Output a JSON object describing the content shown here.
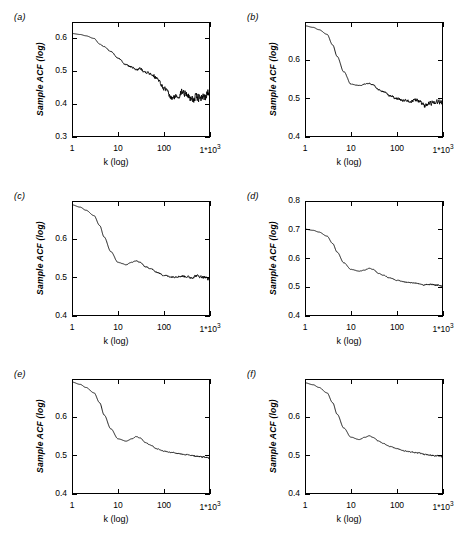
{
  "figure": {
    "layout": "2 columns x 3 rows",
    "axis_titles": {
      "y": "Sample ACF (log)",
      "x": "k (log)"
    },
    "xticks": [
      {
        "label": "1",
        "value": 1
      },
      {
        "label": "10",
        "value": 10
      },
      {
        "label": "100",
        "value": 100
      },
      {
        "label": "1*10",
        "exp": "3",
        "value": 1000
      }
    ]
  },
  "chart_data": [
    {
      "type": "line",
      "panel": "(a)",
      "title": "",
      "xlabel": "k (log)",
      "ylabel": "Sample ACF (log)",
      "xscale": "log",
      "xlim": [
        1,
        1000
      ],
      "ylim": [
        0.3,
        0.65
      ],
      "yticks": [
        0.3,
        0.4,
        0.5,
        0.6
      ],
      "xticks": [
        1,
        10,
        100,
        1000
      ],
      "grid": false,
      "legend": "none",
      "noise_amplitude": 0.022,
      "x": [
        1,
        1.5,
        2,
        3,
        4,
        5,
        7,
        10,
        15,
        20,
        25,
        30,
        40,
        50,
        70,
        100,
        150,
        200,
        250,
        300,
        400,
        500,
        700,
        1000
      ],
      "y": [
        0.615,
        0.612,
        0.608,
        0.6,
        0.583,
        0.575,
        0.56,
        0.54,
        0.52,
        0.512,
        0.505,
        0.508,
        0.498,
        0.494,
        0.48,
        0.448,
        0.418,
        0.425,
        0.438,
        0.432,
        0.415,
        0.42,
        0.418,
        0.44
      ]
    },
    {
      "type": "line",
      "panel": "(b)",
      "title": "",
      "xlabel": "k (log)",
      "ylabel": "Sample ACF (log)",
      "xscale": "log",
      "xlim": [
        1,
        1000
      ],
      "ylim": [
        0.4,
        0.7
      ],
      "yticks": [
        0.4,
        0.5,
        0.6
      ],
      "xticks": [
        1,
        10,
        100,
        1000
      ],
      "grid": false,
      "legend": "none",
      "noise_amplitude": 0.01,
      "x": [
        1,
        1.5,
        2,
        3,
        4,
        5,
        7,
        10,
        15,
        20,
        25,
        30,
        40,
        50,
        70,
        100,
        150,
        200,
        250,
        300,
        400,
        500,
        700,
        1000
      ],
      "y": [
        0.69,
        0.686,
        0.68,
        0.668,
        0.64,
        0.61,
        0.57,
        0.538,
        0.534,
        0.538,
        0.54,
        0.536,
        0.524,
        0.518,
        0.508,
        0.5,
        0.494,
        0.492,
        0.496,
        0.494,
        0.48,
        0.488,
        0.492,
        0.49
      ]
    },
    {
      "type": "line",
      "panel": "(c)",
      "title": "",
      "xlabel": "k (log)",
      "ylabel": "Sample ACF (log)",
      "xscale": "log",
      "xlim": [
        1,
        1000
      ],
      "ylim": [
        0.4,
        0.7
      ],
      "yticks": [
        0.4,
        0.5,
        0.6
      ],
      "xticks": [
        1,
        10,
        100,
        1000
      ],
      "grid": false,
      "legend": "none",
      "noise_amplitude": 0.006,
      "x": [
        1,
        1.5,
        2,
        3,
        4,
        5,
        7,
        10,
        15,
        20,
        25,
        30,
        40,
        50,
        70,
        100,
        150,
        200,
        250,
        300,
        400,
        500,
        700,
        1000
      ],
      "y": [
        0.69,
        0.684,
        0.676,
        0.662,
        0.636,
        0.606,
        0.568,
        0.54,
        0.534,
        0.54,
        0.544,
        0.54,
        0.528,
        0.524,
        0.514,
        0.506,
        0.502,
        0.503,
        0.504,
        0.503,
        0.5,
        0.505,
        0.502,
        0.496
      ]
    },
    {
      "type": "line",
      "panel": "(d)",
      "title": "",
      "xlabel": "k (log)",
      "ylabel": "Sample ACF (log)",
      "xscale": "log",
      "xlim": [
        1,
        1000
      ],
      "ylim": [
        0.4,
        0.8
      ],
      "yticks": [
        0.4,
        0.5,
        0.6,
        0.7,
        0.8
      ],
      "xticks": [
        1,
        10,
        100,
        1000
      ],
      "grid": false,
      "legend": "none",
      "noise_amplitude": 0.004,
      "x": [
        1,
        1.5,
        2,
        3,
        4,
        5,
        7,
        10,
        15,
        20,
        25,
        30,
        40,
        50,
        70,
        100,
        150,
        200,
        250,
        300,
        400,
        500,
        700,
        1000
      ],
      "y": [
        0.702,
        0.698,
        0.692,
        0.678,
        0.652,
        0.622,
        0.585,
        0.562,
        0.556,
        0.56,
        0.566,
        0.562,
        0.548,
        0.542,
        0.532,
        0.524,
        0.518,
        0.516,
        0.514,
        0.513,
        0.508,
        0.51,
        0.508,
        0.505
      ]
    },
    {
      "type": "line",
      "panel": "(e)",
      "title": "",
      "xlabel": "k (log)",
      "ylabel": "Sample ACF (log)",
      "xscale": "log",
      "xlim": [
        1,
        1000
      ],
      "ylim": [
        0.4,
        0.7
      ],
      "yticks": [
        0.4,
        0.5,
        0.6
      ],
      "xticks": [
        1,
        10,
        100,
        1000
      ],
      "grid": false,
      "legend": "none",
      "noise_amplitude": 0.003,
      "x": [
        1,
        1.5,
        2,
        3,
        4,
        5,
        7,
        10,
        15,
        20,
        25,
        30,
        40,
        50,
        70,
        100,
        150,
        200,
        250,
        300,
        400,
        500,
        700,
        1000
      ],
      "y": [
        0.692,
        0.686,
        0.678,
        0.664,
        0.638,
        0.606,
        0.57,
        0.544,
        0.538,
        0.544,
        0.55,
        0.546,
        0.534,
        0.528,
        0.518,
        0.512,
        0.508,
        0.506,
        0.504,
        0.503,
        0.5,
        0.499,
        0.497,
        0.494
      ]
    },
    {
      "type": "line",
      "panel": "(f)",
      "title": "",
      "xlabel": "k (log)",
      "ylabel": "Sample ACF (log)",
      "xscale": "log",
      "xlim": [
        1,
        1000
      ],
      "ylim": [
        0.4,
        0.7
      ],
      "yticks": [
        0.4,
        0.5,
        0.6
      ],
      "xticks": [
        1,
        10,
        100,
        1000
      ],
      "grid": false,
      "legend": "none",
      "noise_amplitude": 0.003,
      "x": [
        1,
        1.5,
        2,
        3,
        4,
        5,
        7,
        10,
        15,
        20,
        25,
        30,
        40,
        50,
        70,
        100,
        150,
        200,
        250,
        300,
        400,
        500,
        700,
        1000
      ],
      "y": [
        0.69,
        0.685,
        0.678,
        0.664,
        0.638,
        0.608,
        0.572,
        0.548,
        0.542,
        0.548,
        0.552,
        0.548,
        0.538,
        0.532,
        0.524,
        0.518,
        0.512,
        0.51,
        0.508,
        0.507,
        0.503,
        0.502,
        0.5,
        0.498
      ]
    }
  ]
}
